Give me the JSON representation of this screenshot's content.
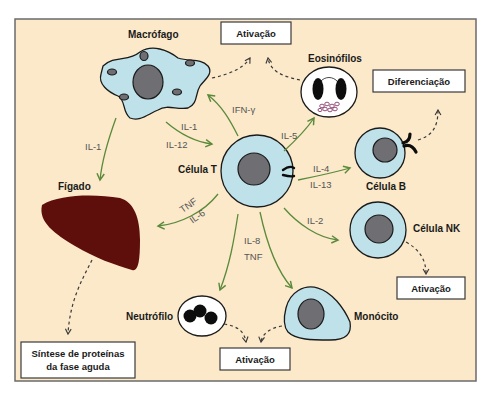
{
  "diagram": {
    "colors": {
      "background": "#fbe9c9",
      "frame": "#6b6b6b",
      "cytoplasm": "#bfe1ea",
      "nucleus": "#6f6f73",
      "liver": "#5e0f0c",
      "arrow_green": "#5b8a3c",
      "eosinophil_granules": "#8a3a6a"
    },
    "cells": {
      "macrophage": "Macrófago",
      "t_cell": "Célula T",
      "eosinophils": "Eosinófilos",
      "b_cell": "Célula B",
      "nk_cell": "Célula NK",
      "liver": "Fígado",
      "neutrophil": "Neutrófilo",
      "monocyte": "Monócito"
    },
    "boxes": {
      "activation_top": "Ativação",
      "differentiation": "Diferenciação",
      "activation_nk": "Ativação",
      "activation_bottom": "Ativação",
      "acute_phase_line1": "Síntese de proteínas",
      "acute_phase_line2": "da fase aguda"
    },
    "cytokines": {
      "macrophage_to_liver": "IL-1",
      "macrophage_to_t_1": "IL-1",
      "macrophage_to_t_2": "IL-12",
      "t_to_macrophage": "IFN-γ",
      "t_to_eosinophil": "IL-5",
      "t_to_b_1": "IL-4",
      "t_to_b_2": "IL-13",
      "t_to_liver_1": "TNF",
      "t_to_liver_2": "IL-6",
      "t_to_nk": "IL-2",
      "t_to_neutrophil_1": "IL-8",
      "t_to_neutrophil_2": "TNF"
    }
  }
}
